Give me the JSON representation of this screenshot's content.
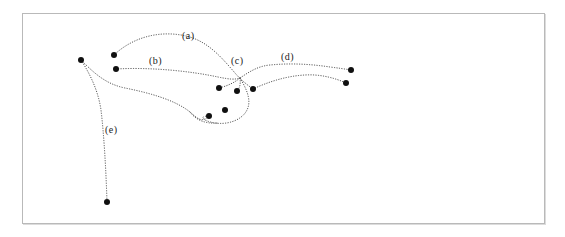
{
  "figure": {
    "type": "dotted-curve-point-diagram",
    "background_color": "#ffffff",
    "frame": {
      "x": 22,
      "y": 13,
      "width": 523,
      "height": 211,
      "border_color": "#b9b9b9",
      "shadow_color": "#dcdcdc"
    },
    "dot_color": "#101010",
    "curve_color": "#3a3a3a",
    "label_color": "#1a1a1a"
  },
  "chart_data": {
    "type": "scatter",
    "title": "",
    "xlabel": "",
    "ylabel": "",
    "grid": false,
    "legend_position": "inline-annotations",
    "xlim": [
      22,
      545
    ],
    "ylim": [
      13,
      224
    ],
    "points": [
      {
        "id": "p1",
        "x": 81,
        "y": 60
      },
      {
        "id": "p2",
        "x": 114,
        "y": 55
      },
      {
        "id": "p3",
        "x": 116,
        "y": 69
      },
      {
        "id": "p4",
        "x": 219,
        "y": 88
      },
      {
        "id": "p5",
        "x": 237,
        "y": 91
      },
      {
        "id": "p6",
        "x": 253,
        "y": 89
      },
      {
        "id": "p7",
        "x": 225,
        "y": 110
      },
      {
        "id": "p8",
        "x": 209,
        "y": 116
      },
      {
        "id": "p9",
        "x": 351,
        "y": 70
      },
      {
        "id": "p10",
        "x": 346,
        "y": 83
      },
      {
        "id": "p11",
        "x": 107,
        "y": 202
      }
    ],
    "point_radius": 3,
    "curves": [
      {
        "id": "a",
        "label": "(a)",
        "label_x": 182,
        "label_y": 31,
        "path": "M 114 55 C 133 37, 160 30, 186 36 C 208 41, 222 58, 235 73 C 240 79, 246 84, 253 89"
      },
      {
        "id": "b",
        "label": "(b)",
        "label_x": 149,
        "label_y": 56,
        "path": "M 116 69 C 150 67, 190 71, 218 77 C 228 79, 234 80, 240 78"
      },
      {
        "id": "c",
        "label": "(c)",
        "label_x": 231,
        "label_y": 56,
        "path": "M 240 78 C 234 83, 227 86, 219 88 M 240 78 C 241 85, 239 89, 237 91 M 240 78 C 246 88, 252 100, 247 110 C 242 120, 228 125, 215 123 C 203 121, 198 116, 209 116"
      },
      {
        "id": "d",
        "label": "(d)",
        "label_x": 281,
        "label_y": 52,
        "path": "M 240 78 C 249 72, 258 66, 270 65 C 290 63, 310 64, 330 67 C 338 68, 345 69, 351 70 M 253 89 C 268 82, 286 76, 305 75 C 320 74, 335 78, 346 83"
      },
      {
        "id": "e",
        "label": "(e)",
        "label_x": 105,
        "label_y": 125,
        "path": "M 81 60 C 90 74, 98 90, 101 110 C 104 135, 106 170, 107 202 M 81 60 C 95 74, 106 84, 125 88 C 150 93, 175 100, 190 112 C 198 119, 202 123, 209 116 M 190 112 C 196 120, 205 124, 218 123"
      }
    ]
  }
}
